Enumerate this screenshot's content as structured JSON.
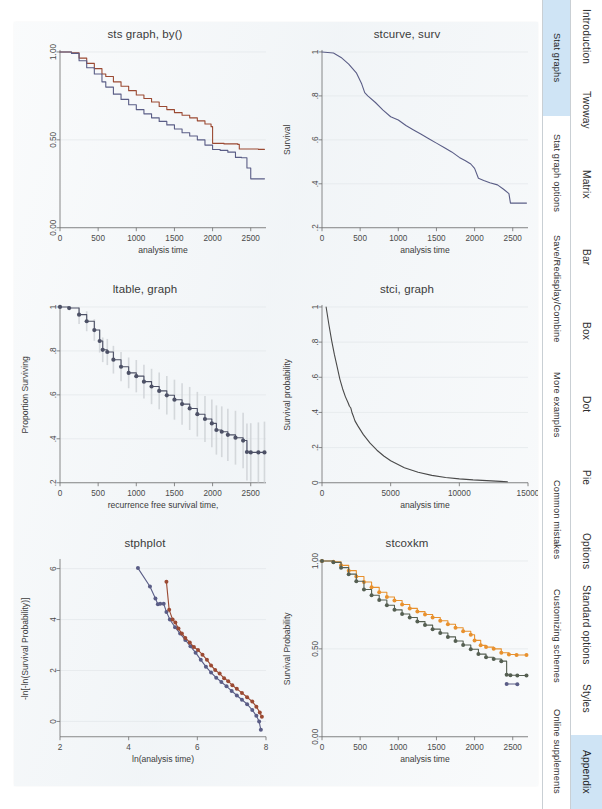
{
  "page": {
    "background_color": "#ffffff",
    "sheet_color": "#f3f6f8",
    "accent_color": "#cfe4f5"
  },
  "sidebar": {
    "columns": [
      {
        "name": "section-tabs",
        "items": [
          {
            "label": "Stat graphs",
            "active": true
          },
          {
            "label": "Stat graph options",
            "active": false
          },
          {
            "label": "Save/Redisplay/Combine",
            "active": false
          },
          {
            "label": "More examples",
            "active": false
          },
          {
            "label": "Common mistakes",
            "active": false
          },
          {
            "label": "Customizing schemes",
            "active": false
          },
          {
            "label": "Online supplements",
            "active": false
          }
        ]
      },
      {
        "name": "chapter-tabs",
        "items": [
          {
            "label": "Introduction",
            "active": false
          },
          {
            "label": "Twoway",
            "active": false
          },
          {
            "label": "Matrix",
            "active": false
          },
          {
            "label": "Bar",
            "active": false
          },
          {
            "label": "Box",
            "active": false
          },
          {
            "label": "Dot",
            "active": false
          },
          {
            "label": "Pie",
            "active": false
          },
          {
            "label": "Options",
            "active": false
          },
          {
            "label": "Standard options",
            "active": false
          },
          {
            "label": "Styles",
            "active": false
          },
          {
            "label": "Appendix",
            "active": true
          }
        ]
      }
    ]
  },
  "charts": [
    {
      "id": "sts-graph-by",
      "title": "sts graph, by()",
      "xlabel": "analysis time",
      "ylabel": "",
      "xticks": [
        "0",
        "500",
        "1000",
        "1500",
        "2000",
        "2500"
      ],
      "yticks": [
        "0.00",
        "0.50",
        "1.00"
      ]
    },
    {
      "id": "stcurve-surv",
      "title": "stcurve, surv",
      "xlabel": "analysis time",
      "ylabel": "Survival",
      "xticks": [
        "0",
        "500",
        "1000",
        "1500",
        "2000",
        "2500"
      ],
      "yticks": [
        ".2",
        ".4",
        ".6",
        ".8",
        "1"
      ]
    },
    {
      "id": "ltable-graph",
      "title": "ltable, graph",
      "xlabel": "recurrence free survival time,",
      "ylabel": "Proportion Surviving",
      "xticks": [
        "0",
        "500",
        "1000",
        "1500",
        "2000",
        "2500"
      ],
      "yticks": [
        ".2",
        ".4",
        ".6",
        ".8",
        "1"
      ]
    },
    {
      "id": "stci-graph",
      "title": "stci, graph",
      "xlabel": "analysis time",
      "ylabel": "Survival probability",
      "xticks": [
        "0",
        "5000",
        "10000",
        "15000"
      ],
      "yticks": [
        "0",
        ".2",
        ".4",
        ".6",
        ".8",
        "1"
      ]
    },
    {
      "id": "stphplot",
      "title": "stphplot",
      "xlabel": "ln(analysis time)",
      "ylabel": "-ln[-ln(Survival Probability)]",
      "xticks": [
        "2",
        "4",
        "6",
        "8"
      ],
      "yticks": [
        "0",
        "2",
        "4",
        "6"
      ]
    },
    {
      "id": "stcoxkm",
      "title": "stcoxkm",
      "xlabel": "analysis time",
      "ylabel": "Survival Probability",
      "xticks": [
        "0",
        "500",
        "1000",
        "1500",
        "2000",
        "2500"
      ],
      "yticks": [
        "0.00",
        "0.50",
        "1.00"
      ]
    }
  ],
  "chart_data": [
    {
      "type": "line",
      "id": "sts-graph-by",
      "title": "sts graph, by()",
      "xlabel": "analysis time",
      "ylabel": "",
      "xlim": [
        0,
        2700
      ],
      "ylim": [
        0,
        1.0
      ],
      "grid": true,
      "legend": "none",
      "series": [
        {
          "name": "group-1",
          "color": "#9b4a33",
          "x": [
            0,
            150,
            250,
            350,
            450,
            550,
            600,
            700,
            800,
            900,
            1000,
            1100,
            1200,
            1300,
            1400,
            1500,
            1600,
            1700,
            1800,
            1900,
            1980,
            2000,
            2150,
            2330,
            2350,
            2600,
            2680
          ],
          "y": [
            1.0,
            0.995,
            0.965,
            0.935,
            0.905,
            0.875,
            0.86,
            0.83,
            0.805,
            0.78,
            0.755,
            0.735,
            0.715,
            0.69,
            0.672,
            0.655,
            0.64,
            0.625,
            0.608,
            0.59,
            0.575,
            0.48,
            0.477,
            0.474,
            0.448,
            0.446,
            0.446
          ]
        },
        {
          "name": "group-2",
          "color": "#5a5d86",
          "x": [
            0,
            150,
            250,
            350,
            450,
            550,
            600,
            700,
            800,
            900,
            1000,
            1100,
            1200,
            1300,
            1400,
            1500,
            1600,
            1700,
            1800,
            1900,
            2000,
            2100,
            2200,
            2300,
            2380,
            2450,
            2500,
            2680
          ],
          "y": [
            1.0,
            0.992,
            0.95,
            0.91,
            0.875,
            0.83,
            0.8,
            0.76,
            0.73,
            0.7,
            0.672,
            0.648,
            0.625,
            0.605,
            0.585,
            0.562,
            0.54,
            0.522,
            0.5,
            0.47,
            0.445,
            0.44,
            0.43,
            0.4,
            0.398,
            0.34,
            0.278,
            0.278
          ]
        }
      ]
    },
    {
      "type": "line",
      "id": "stcurve-surv",
      "title": "stcurve, surv",
      "xlabel": "analysis time",
      "ylabel": "Survival",
      "xlim": [
        0,
        2700
      ],
      "ylim": [
        0.2,
        1.0
      ],
      "grid": true,
      "legend": "none",
      "series": [
        {
          "name": "survival",
          "color": "#5a5d86",
          "x": [
            0,
            150,
            250,
            350,
            450,
            520,
            560,
            600,
            700,
            800,
            900,
            1000,
            1100,
            1200,
            1300,
            1400,
            1500,
            1600,
            1700,
            1800,
            1880,
            1950,
            2000,
            2050,
            2120,
            2200,
            2300,
            2380,
            2450,
            2470,
            2680
          ],
          "y": [
            1.0,
            0.995,
            0.975,
            0.945,
            0.905,
            0.855,
            0.815,
            0.8,
            0.77,
            0.735,
            0.705,
            0.69,
            0.665,
            0.645,
            0.625,
            0.605,
            0.585,
            0.565,
            0.545,
            0.52,
            0.505,
            0.49,
            0.47,
            0.425,
            0.415,
            0.405,
            0.395,
            0.375,
            0.355,
            0.312,
            0.312
          ]
        }
      ]
    },
    {
      "type": "line",
      "id": "ltable-graph",
      "title": "ltable, graph",
      "xlabel": "recurrence free survival time,",
      "ylabel": "Proportion Surviving",
      "xlim": [
        0,
        2700
      ],
      "ylim": [
        0.2,
        1.0
      ],
      "grid": true,
      "legend": "none",
      "note": "step curve with grey confidence-interval whiskers, thick marker line",
      "series": [
        {
          "name": "proportion-surviving",
          "color": "#4d5166",
          "x": [
            0,
            120,
            250,
            350,
            450,
            520,
            560,
            620,
            700,
            800,
            900,
            1000,
            1100,
            1200,
            1300,
            1400,
            1500,
            1600,
            1700,
            1800,
            1900,
            1990,
            2050,
            2120,
            2200,
            2300,
            2400,
            2450,
            2500,
            2600,
            2680
          ],
          "y": [
            1.0,
            0.995,
            0.965,
            0.935,
            0.895,
            0.845,
            0.805,
            0.795,
            0.76,
            0.728,
            0.7,
            0.685,
            0.66,
            0.638,
            0.618,
            0.598,
            0.578,
            0.558,
            0.538,
            0.512,
            0.49,
            0.47,
            0.44,
            0.432,
            0.418,
            0.405,
            0.392,
            0.34,
            0.338,
            0.338,
            0.338
          ]
        }
      ],
      "ci_band_color": "#cfd3d7"
    },
    {
      "type": "line",
      "id": "stci-graph",
      "title": "stci, graph",
      "xlabel": "analysis time",
      "ylabel": "Survival probability",
      "xlim": [
        0,
        15000
      ],
      "ylim": [
        0,
        1.0
      ],
      "grid": true,
      "legend": "none",
      "series": [
        {
          "name": "survival-probability",
          "color": "#4a4a4a",
          "x": [
            300,
            500,
            700,
            900,
            1100,
            1300,
            1500,
            1700,
            1900,
            2000,
            2100,
            2200,
            2300,
            2400,
            2600,
            3000,
            3500,
            4000,
            4500,
            5000,
            6000,
            7000,
            8000,
            9000,
            10000,
            11000,
            12000,
            13000,
            13500
          ],
          "y": [
            1.0,
            0.9,
            0.81,
            0.73,
            0.66,
            0.59,
            0.535,
            0.49,
            0.455,
            0.435,
            0.425,
            0.395,
            0.375,
            0.352,
            0.325,
            0.275,
            0.225,
            0.185,
            0.152,
            0.125,
            0.085,
            0.06,
            0.042,
            0.03,
            0.022,
            0.016,
            0.012,
            0.008,
            0.006
          ]
        }
      ]
    },
    {
      "type": "scatter",
      "id": "stphplot",
      "title": "stphplot",
      "xlabel": "ln(analysis time)",
      "ylabel": "-ln[-ln(Survival Probability)]",
      "xlim": [
        2,
        8
      ],
      "ylim": [
        -0.6,
        6.3
      ],
      "grid": true,
      "legend": "none",
      "series": [
        {
          "name": "group-1",
          "color": "#5a5d86",
          "x": [
            4.27,
            4.62,
            4.78,
            4.85,
            4.92,
            5.02,
            5.1,
            5.2,
            5.35,
            5.5,
            5.65,
            5.8,
            5.95,
            6.1,
            6.25,
            6.4,
            6.55,
            6.7,
            6.85,
            7.0,
            7.15,
            7.3,
            7.45,
            7.6,
            7.72,
            7.8,
            7.85
          ],
          "y": [
            6.02,
            5.3,
            4.83,
            4.6,
            4.62,
            4.62,
            4.3,
            4.0,
            3.7,
            3.45,
            3.2,
            2.95,
            2.7,
            2.42,
            2.15,
            1.92,
            1.72,
            1.55,
            1.38,
            1.2,
            1.02,
            0.85,
            0.68,
            0.45,
            0.22,
            0.0,
            -0.33
          ]
        },
        {
          "name": "group-2",
          "color": "#9b4a33",
          "x": [
            5.1,
            5.18,
            5.28,
            5.36,
            5.45,
            5.55,
            5.65,
            5.78,
            5.9,
            6.02,
            6.15,
            6.28,
            6.4,
            6.52,
            6.65,
            6.78,
            6.9,
            7.02,
            7.15,
            7.3,
            7.45,
            7.6,
            7.72,
            7.82,
            7.88
          ],
          "y": [
            5.48,
            4.38,
            4.0,
            3.88,
            3.65,
            3.45,
            3.28,
            3.1,
            2.92,
            2.8,
            2.62,
            2.42,
            2.2,
            2.02,
            1.88,
            1.7,
            1.58,
            1.42,
            1.28,
            1.12,
            0.95,
            0.78,
            0.58,
            0.35,
            0.18
          ]
        }
      ]
    },
    {
      "type": "line",
      "id": "stcoxkm",
      "title": "stcoxkm",
      "xlabel": "analysis time",
      "ylabel": "Survival Probability",
      "xlim": [
        0,
        2700
      ],
      "ylim": [
        0,
        1.0
      ],
      "grid": true,
      "legend": "none",
      "series": [
        {
          "name": "predicted",
          "color": "#e8912e",
          "x": [
            0,
            150,
            250,
            350,
            450,
            550,
            650,
            750,
            850,
            950,
            1050,
            1150,
            1250,
            1350,
            1450,
            1550,
            1650,
            1750,
            1850,
            1950,
            2000,
            2080,
            2150,
            2250,
            2350,
            2450,
            2550,
            2680
          ],
          "y": [
            1.0,
            0.995,
            0.975,
            0.945,
            0.912,
            0.88,
            0.85,
            0.822,
            0.795,
            0.775,
            0.752,
            0.73,
            0.712,
            0.695,
            0.678,
            0.66,
            0.64,
            0.62,
            0.6,
            0.58,
            0.548,
            0.52,
            0.51,
            0.5,
            0.478,
            0.468,
            0.465,
            0.465
          ]
        },
        {
          "name": "observed",
          "color": "#555f52",
          "x": [
            0,
            150,
            250,
            350,
            450,
            550,
            650,
            750,
            850,
            950,
            1050,
            1150,
            1250,
            1350,
            1450,
            1550,
            1650,
            1750,
            1850,
            1950,
            2050,
            2150,
            2250,
            2350,
            2420,
            2470,
            2560,
            2680
          ],
          "y": [
            1.0,
            0.992,
            0.962,
            0.925,
            0.885,
            0.838,
            0.805,
            0.778,
            0.748,
            0.722,
            0.698,
            0.678,
            0.655,
            0.635,
            0.612,
            0.59,
            0.568,
            0.545,
            0.522,
            0.498,
            0.47,
            0.452,
            0.442,
            0.43,
            0.352,
            0.35,
            0.348,
            0.348
          ]
        },
        {
          "name": "observed-marker-2",
          "color": "#5a5d86",
          "x": [
            2420,
            2560
          ],
          "y": [
            0.3,
            0.298
          ]
        }
      ]
    }
  ]
}
